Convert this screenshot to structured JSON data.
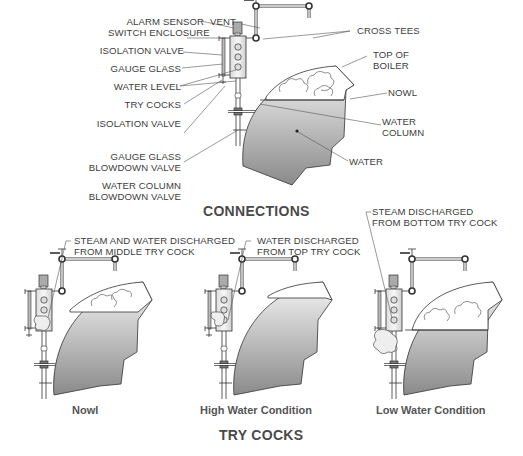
{
  "connections": {
    "title": "CONNECTIONS",
    "labels_left": [
      {
        "id": "alarm-sensor",
        "line1": "ALARM SENSOR",
        "line2": "SWITCH ENCLOSURE"
      },
      {
        "id": "isolation-valve-top",
        "line1": "ISOLATION VALVE"
      },
      {
        "id": "gauge-glass",
        "line1": "GAUGE GLASS"
      },
      {
        "id": "water-level",
        "line1": "WATER LEVEL"
      },
      {
        "id": "try-cocks",
        "line1": "TRY COCKS"
      },
      {
        "id": "isolation-valve-bottom",
        "line1": "ISOLATION VALVE"
      },
      {
        "id": "gauge-glass-blowdown",
        "line1": "GAUGE GLASS",
        "line2": "BLOWDOWN VALVE"
      },
      {
        "id": "water-column-blowdown",
        "line1": "WATER COLUMN",
        "line2": "BLOWDOWN VALVE"
      }
    ],
    "labels_right": [
      {
        "id": "vent",
        "line1": "VENT"
      },
      {
        "id": "cross-tees",
        "line1": "CROSS TEES"
      },
      {
        "id": "top-of-boiler",
        "line1": "TOP OF",
        "line2": "BOILER"
      },
      {
        "id": "nowl",
        "line1": "NOWL"
      },
      {
        "id": "water-column",
        "line1": "WATER",
        "line2": "COLUMN"
      },
      {
        "id": "water",
        "line1": "WATER"
      }
    ]
  },
  "try_cocks": {
    "title": "TRY COCKS",
    "panels": [
      {
        "caption": "Nowl",
        "callout1": "STEAM AND WATER DISCHARGED",
        "callout2": "FROM MIDDLE TRY COCK"
      },
      {
        "caption": "High Water Condition",
        "callout1": "WATER DISCHARGED",
        "callout2": "FROM TOP TRY COCK"
      },
      {
        "caption": "Low Water Condition",
        "callout1": "STEAM DISCHARGED",
        "callout2": "FROM BOTTOM TRY COCK"
      }
    ]
  },
  "colors": {
    "line": "#333333",
    "water_top": "#f2f2f2",
    "water_bottom": "#8a8a8a",
    "text": "#3d3d3d"
  }
}
